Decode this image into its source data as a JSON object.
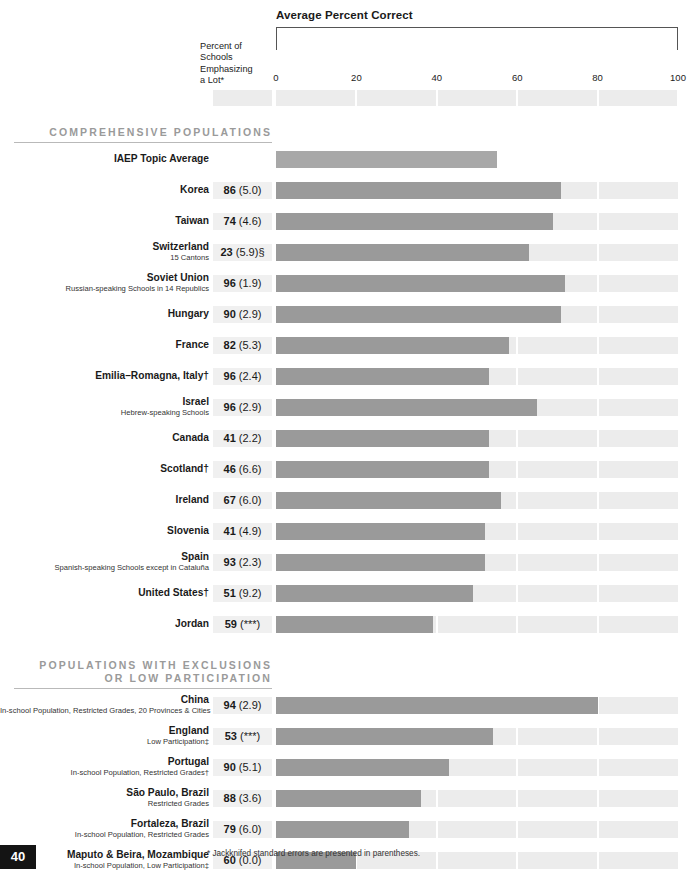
{
  "header": {
    "chart_title": "Average Percent Correct",
    "column_caption": "Percent of\nSchools\nEmphasizing\na Lot*"
  },
  "footnote": "* Jackknifed standard errors are presented in parentheses.",
  "page_number": "40",
  "colors": {
    "bar": "#9a9a9a",
    "track": "#ececec",
    "value_bg": "#f0f0f0",
    "section_head": "#9a9a9a",
    "page_box": "#141414"
  },
  "sections": [
    {
      "title": "COMPREHENSIVE POPULATIONS"
    },
    {
      "title": "POPULATIONS WITH EXCLUSIONS\nOR LOW PARTICIPATION"
    }
  ],
  "chart_data": {
    "type": "bar",
    "title": "Average Percent Correct",
    "xlabel": "",
    "ylabel": "",
    "xlim": [
      0,
      100
    ],
    "ticks": [
      0,
      20,
      40,
      60,
      80,
      100
    ],
    "tick_labels": [
      "0",
      "20",
      "40",
      "60",
      "80",
      "100"
    ],
    "grid": true,
    "legend": "none",
    "value_column_header": "Percent of Schools Emphasizing a Lot*",
    "value_series_name": "Percent of Schools Emphasizing a Lot",
    "bar_series_name": "Average Percent Correct",
    "sections": [
      {
        "title": "COMPREHENSIVE POPULATIONS",
        "rows": [
          {
            "name": "IAEP Topic Average",
            "sub": "",
            "percent_emphasizing": null,
            "se": null,
            "value_text": "",
            "average_percent_correct": 55,
            "is_average": true
          },
          {
            "name": "Korea",
            "sub": "",
            "percent_emphasizing": 86,
            "se": "(5.0)",
            "value_text": "86 (5.0)",
            "average_percent_correct": 71
          },
          {
            "name": "Taiwan",
            "sub": "",
            "percent_emphasizing": 74,
            "se": "(4.6)",
            "value_text": "74 (4.6)",
            "average_percent_correct": 69
          },
          {
            "name": "Switzerland",
            "sub": "15 Cantons",
            "percent_emphasizing": 23,
            "se": "(5.9)§",
            "value_text": "23 (5.9)§",
            "average_percent_correct": 63
          },
          {
            "name": "Soviet Union",
            "sub": "Russian-speaking Schools in 14 Republics",
            "percent_emphasizing": 96,
            "se": "(1.9)",
            "value_text": "96 (1.9)",
            "average_percent_correct": 72
          },
          {
            "name": "Hungary",
            "sub": "",
            "percent_emphasizing": 90,
            "se": "(2.9)",
            "value_text": "90 (2.9)",
            "average_percent_correct": 71
          },
          {
            "name": "France",
            "sub": "",
            "percent_emphasizing": 82,
            "se": "(5.3)",
            "value_text": "82 (5.3)",
            "average_percent_correct": 58
          },
          {
            "name": "Emilia–Romagna, Italy†",
            "sub": "",
            "percent_emphasizing": 96,
            "se": "(2.4)",
            "value_text": "96 (2.4)",
            "average_percent_correct": 53
          },
          {
            "name": "Israel",
            "sub": "Hebrew-speaking Schools",
            "percent_emphasizing": 96,
            "se": "(2.9)",
            "value_text": "96 (2.9)",
            "average_percent_correct": 65
          },
          {
            "name": "Canada",
            "sub": "",
            "percent_emphasizing": 41,
            "se": "(2.2)",
            "value_text": "41 (2.2)",
            "average_percent_correct": 53
          },
          {
            "name": "Scotland†",
            "sub": "",
            "percent_emphasizing": 46,
            "se": "(6.6)",
            "value_text": "46 (6.6)",
            "average_percent_correct": 53
          },
          {
            "name": "Ireland",
            "sub": "",
            "percent_emphasizing": 67,
            "se": "(6.0)",
            "value_text": "67 (6.0)",
            "average_percent_correct": 56
          },
          {
            "name": "Slovenia",
            "sub": "",
            "percent_emphasizing": 41,
            "se": "(4.9)",
            "value_text": "41 (4.9)",
            "average_percent_correct": 52
          },
          {
            "name": "Spain",
            "sub": "Spanish-speaking Schools except in Cataluña",
            "percent_emphasizing": 93,
            "se": "(2.3)",
            "value_text": "93 (2.3)",
            "average_percent_correct": 52
          },
          {
            "name": "United States†",
            "sub": "",
            "percent_emphasizing": 51,
            "se": "(9.2)",
            "value_text": "51 (9.2)",
            "average_percent_correct": 49
          },
          {
            "name": "Jordan",
            "sub": "",
            "percent_emphasizing": 59,
            "se": "(***)",
            "value_text": "59 (***)",
            "average_percent_correct": 39
          }
        ]
      },
      {
        "title": "POPULATIONS WITH EXCLUSIONS OR LOW PARTICIPATION",
        "rows": [
          {
            "name": "China",
            "sub": "In-school Population, Restricted Grades, 20 Provinces & Cities",
            "percent_emphasizing": 94,
            "se": "(2.9)",
            "value_text": "94 (2.9)",
            "average_percent_correct": 80
          },
          {
            "name": "England",
            "sub": "Low Participation‡",
            "percent_emphasizing": 53,
            "se": "(***)",
            "value_text": "53 (***)",
            "average_percent_correct": 54
          },
          {
            "name": "Portugal",
            "sub": "In-school Population, Restricted Grades†",
            "percent_emphasizing": 90,
            "se": "(5.1)",
            "value_text": "90 (5.1)",
            "average_percent_correct": 43
          },
          {
            "name": "São Paulo, Brazil",
            "sub": "Restricted Grades",
            "percent_emphasizing": 88,
            "se": "(3.6)",
            "value_text": "88 (3.6)",
            "average_percent_correct": 36
          },
          {
            "name": "Fortaleza, Brazil",
            "sub": "In-school Population, Restricted Grades",
            "percent_emphasizing": 79,
            "se": "(6.0)",
            "value_text": "79 (6.0)",
            "average_percent_correct": 33
          },
          {
            "name": "Maputo & Beira, Mozambique",
            "sub": "In-school Population, Low Participation‡",
            "percent_emphasizing": 60,
            "se": "(0.0)",
            "value_text": "60 (0.0)",
            "average_percent_correct": 20
          }
        ]
      }
    ]
  }
}
